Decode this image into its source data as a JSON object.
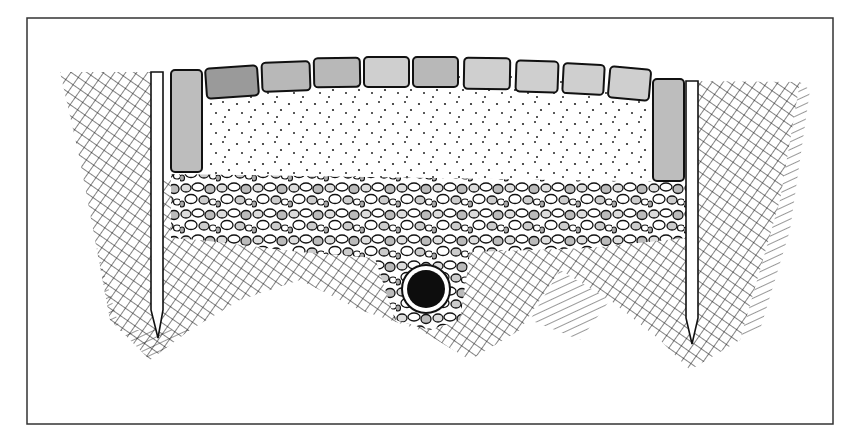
{
  "figure": {
    "title": "",
    "caption": "",
    "frame": {
      "x": 27,
      "y": 18,
      "width": 806,
      "height": 406,
      "stroke": "#333333"
    },
    "colors": {
      "background": "#ffffff",
      "ink": "#1a1a1a",
      "brick_dark": "#9a9a9a",
      "brick_mid": "#b8b8b8",
      "brick_light": "#cfcfcf",
      "edge_brick": "#bdbdbd",
      "pipe": "#0d0d0d"
    },
    "components": [
      {
        "id": "paving-bricks",
        "count": 10
      },
      {
        "id": "edging-bricks",
        "count": 2
      },
      {
        "id": "stakes",
        "count": 2
      },
      {
        "id": "sand-bed"
      },
      {
        "id": "gravel-base"
      },
      {
        "id": "drain-pipe"
      },
      {
        "id": "soil-hatching"
      }
    ],
    "bricks": [
      {
        "x": 206,
        "y": 67,
        "w": 52,
        "h": 30,
        "rot": -4,
        "shade": "brick_dark"
      },
      {
        "x": 262,
        "y": 62,
        "w": 48,
        "h": 29,
        "rot": -2,
        "shade": "brick_mid"
      },
      {
        "x": 314,
        "y": 58,
        "w": 46,
        "h": 29,
        "rot": -1,
        "shade": "brick_mid"
      },
      {
        "x": 364,
        "y": 57,
        "w": 45,
        "h": 30,
        "rot": 0,
        "shade": "brick_light"
      },
      {
        "x": 413,
        "y": 57,
        "w": 45,
        "h": 30,
        "rot": 0,
        "shade": "brick_mid"
      },
      {
        "x": 464,
        "y": 58,
        "w": 46,
        "h": 31,
        "rot": 1,
        "shade": "brick_light"
      },
      {
        "x": 516,
        "y": 61,
        "w": 42,
        "h": 31,
        "rot": 2,
        "shade": "brick_light"
      },
      {
        "x": 563,
        "y": 64,
        "w": 41,
        "h": 30,
        "rot": 3,
        "shade": "brick_light"
      },
      {
        "x": 609,
        "y": 68,
        "w": 41,
        "h": 31,
        "rot": 5,
        "shade": "brick_light"
      }
    ],
    "edge_bricks": [
      {
        "x": 171,
        "y": 70,
        "w": 31,
        "h": 102
      },
      {
        "x": 653,
        "y": 79,
        "w": 31,
        "h": 102
      }
    ],
    "stakes": [
      {
        "x": 153,
        "top": 72,
        "bottom": 338
      },
      {
        "x": 686,
        "top": 81,
        "bottom": 344
      }
    ],
    "pipe": {
      "cx": 426,
      "cy": 289,
      "r_outer": 24,
      "r_inner": 19
    }
  }
}
